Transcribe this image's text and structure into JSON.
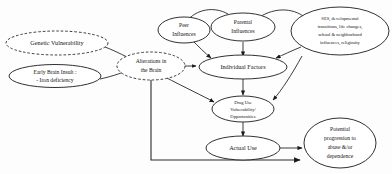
{
  "diagram": {
    "background_color": "#fdfdfd",
    "stroke_color": "#1a1a1a",
    "nodes": {
      "genetic_vulnerability": {
        "label": "Genetic Vulnerability",
        "style": "dashed-ellipse"
      },
      "early_brain_insult": {
        "line1": "Early Brain Insult :",
        "line2": "- Iron deficiency",
        "style": "solid-ellipse"
      },
      "alterations_brain": {
        "line1": "Alterations in",
        "line2": "the Brain",
        "style": "dashed-ellipse"
      },
      "peer_influences": {
        "line1": "Peer",
        "line2": "Influences",
        "style": "solid-ellipse"
      },
      "parental_influences": {
        "line1": "Parental",
        "line2": "Influences",
        "style": "solid-ellipse"
      },
      "ses_context": {
        "line1": "SES, developmental",
        "line2": "transitions, life changes,",
        "line3": "school & neighborhood",
        "line4": "influences, religiosity",
        "style": "solid-ellipse"
      },
      "individual_factors": {
        "label": "Individual Factors",
        "style": "solid-ellipse"
      },
      "drug_use_vulnerability": {
        "line1": "Drug Use",
        "line2": "Vulnerability/",
        "line3": "Opportunities",
        "style": "solid-ellipse"
      },
      "actual_use": {
        "label": "Actual Use",
        "style": "solid-ellipse"
      },
      "potential_progression": {
        "line1": "Potential",
        "line2": "progression to",
        "line3": "abuse &/or",
        "line4": "dependence",
        "style": "solid-ellipse"
      }
    }
  }
}
